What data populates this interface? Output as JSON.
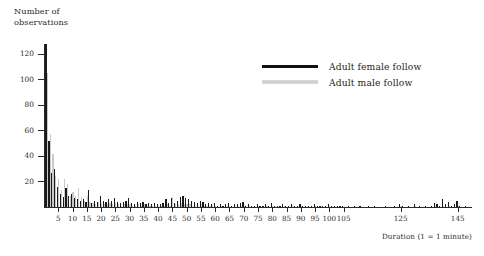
{
  "chart_data": {
    "type": "bar",
    "title": "",
    "subtitle": "",
    "xlabel": "Duration (1 = 1 minute)",
    "ylabel": "Number of observations",
    "grid": false,
    "legend_position": "upper-center-right",
    "xlim": [
      0,
      150
    ],
    "ylim": [
      0,
      128
    ],
    "yticks": [
      20,
      40,
      60,
      80,
      100,
      120
    ],
    "xticks": [
      5,
      10,
      15,
      20,
      25,
      30,
      35,
      40,
      45,
      50,
      55,
      60,
      65,
      70,
      75,
      80,
      85,
      90,
      95,
      100,
      105,
      125,
      145
    ],
    "xtick_labels": [
      "5",
      "10",
      "15",
      "20",
      "25",
      "30",
      "35",
      "40",
      "45",
      "50",
      "55",
      "60",
      "65",
      "70",
      "75",
      "80",
      "85",
      "90",
      "95",
      "100",
      "105",
      "125",
      "145"
    ],
    "x": [
      1,
      2,
      3,
      4,
      5,
      6,
      7,
      8,
      9,
      10,
      11,
      12,
      13,
      14,
      15,
      16,
      17,
      18,
      19,
      20,
      21,
      22,
      23,
      24,
      25,
      26,
      27,
      28,
      29,
      30,
      31,
      32,
      33,
      34,
      35,
      36,
      37,
      38,
      39,
      40,
      41,
      42,
      43,
      44,
      45,
      46,
      47,
      48,
      49,
      50,
      51,
      52,
      53,
      54,
      55,
      56,
      57,
      58,
      59,
      60,
      61,
      62,
      63,
      64,
      65,
      66,
      67,
      68,
      69,
      70,
      71,
      72,
      73,
      74,
      75,
      76,
      77,
      78,
      79,
      80,
      81,
      82,
      83,
      84,
      85,
      86,
      87,
      88,
      89,
      90,
      91,
      92,
      93,
      94,
      95,
      96,
      97,
      98,
      99,
      100,
      101,
      102,
      103,
      104,
      105,
      106,
      107,
      108,
      109,
      110,
      111,
      112,
      113,
      114,
      115,
      116,
      117,
      118,
      119,
      120,
      121,
      122,
      123,
      124,
      125,
      126,
      127,
      128,
      129,
      130,
      131,
      132,
      133,
      134,
      135,
      136,
      137,
      138,
      139,
      140,
      141,
      142,
      143,
      144,
      145,
      146,
      147,
      148
    ],
    "series": [
      {
        "name": "Adult female follow",
        "color": "#1a1a1a",
        "values": [
          128,
          52,
          27,
          30,
          16,
          10,
          8,
          15,
          9,
          10,
          7,
          6,
          5,
          6,
          4,
          13,
          3,
          5,
          4,
          9,
          5,
          4,
          6,
          5,
          7,
          4,
          3,
          4,
          5,
          7,
          3,
          2,
          4,
          3,
          4,
          2,
          3,
          2,
          3,
          2,
          2,
          3,
          6,
          3,
          7,
          3,
          5,
          8,
          9,
          7,
          6,
          5,
          4,
          3,
          5,
          4,
          2,
          3,
          2,
          3,
          1,
          2,
          1,
          2,
          3,
          1,
          2,
          2,
          3,
          4,
          1,
          2,
          1,
          1,
          2,
          1,
          1,
          2,
          1,
          3,
          1,
          1,
          1,
          2,
          1,
          1,
          2,
          1,
          1,
          2,
          1,
          1,
          1,
          1,
          2,
          1,
          1,
          1,
          1,
          2,
          1,
          1,
          1,
          1,
          1,
          0,
          1,
          0,
          1,
          0,
          1,
          0,
          0,
          1,
          0,
          1,
          0,
          0,
          0,
          1,
          0,
          0,
          1,
          0,
          2,
          1,
          0,
          1,
          0,
          2,
          0,
          1,
          0,
          1,
          0,
          1,
          3,
          2,
          1,
          6,
          2,
          4,
          1,
          2,
          5,
          1,
          0,
          1
        ]
      },
      {
        "name": "Adult male follow",
        "color": "#c9c9c9",
        "values": [
          105,
          57,
          42,
          24,
          22,
          13,
          22,
          18,
          9,
          12,
          9,
          15,
          8,
          5,
          9,
          4,
          3,
          2,
          4,
          3,
          2,
          2,
          3,
          2,
          3,
          2,
          1,
          2,
          2,
          2,
          1,
          1,
          2,
          1,
          2,
          1,
          1,
          1,
          1,
          1,
          1,
          1,
          2,
          1,
          8,
          2,
          2,
          3,
          2,
          2,
          2,
          1,
          1,
          1,
          2,
          1,
          1,
          1,
          1,
          1,
          0,
          1,
          0,
          1,
          1,
          0,
          1,
          1,
          1,
          1,
          0,
          1,
          0,
          0,
          1,
          0,
          0,
          1,
          0,
          1,
          0,
          0,
          0,
          1,
          0,
          0,
          1,
          0,
          0,
          1,
          0,
          0,
          0,
          0,
          1,
          0,
          0,
          0,
          0,
          1,
          0,
          0,
          0,
          0,
          0,
          0,
          0,
          0,
          0,
          0,
          0,
          0,
          0,
          0,
          0,
          0,
          0,
          0,
          0,
          0,
          0,
          0,
          0,
          0,
          1,
          0,
          0,
          0,
          0,
          1,
          0,
          0,
          0,
          0,
          0,
          0,
          1,
          0,
          0,
          1,
          0,
          1,
          0,
          0,
          1,
          0,
          0,
          0
        ]
      }
    ],
    "legend": [
      {
        "label": "Adult female follow",
        "color": "#1a1a1a",
        "style": "thick-line"
      },
      {
        "label": "Adult male follow",
        "color": "#c9c9c9",
        "style": "thin-line"
      }
    ]
  },
  "axis": {
    "y_title": "Number of\nobservations",
    "x_title": "Duration (1 = 1 minute)"
  }
}
